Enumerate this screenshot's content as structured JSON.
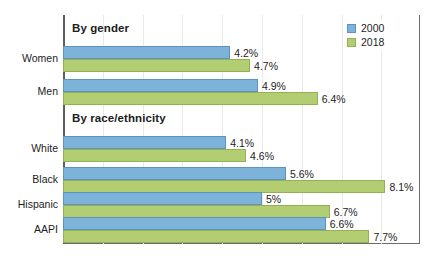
{
  "chart_data": {
    "type": "bar",
    "orientation": "horizontal",
    "title": "",
    "xlabel": "",
    "ylabel": "",
    "xlim": [
      0,
      9
    ],
    "grid": true,
    "legend_position": "top-right",
    "series": [
      {
        "name": "2000",
        "color": "#7db2d9"
      },
      {
        "name": "2018",
        "color": "#b2cd72"
      }
    ],
    "sections": [
      {
        "heading": "By gender",
        "categories": [
          "Women",
          "Men"
        ],
        "rows": [
          {
            "category": "Women",
            "values": [
              4.2,
              4.7
            ],
            "labels": [
              "4.2%",
              "4.7%"
            ]
          },
          {
            "category": "Men",
            "values": [
              4.9,
              6.4
            ],
            "labels": [
              "4.9%",
              "6.4%"
            ]
          }
        ]
      },
      {
        "heading": "By race/ethnicity",
        "categories": [
          "White",
          "Black",
          "Hispanic",
          "AAPI"
        ],
        "rows": [
          {
            "category": "White",
            "values": [
              4.1,
              4.6
            ],
            "labels": [
              "4.1%",
              "4.6%"
            ]
          },
          {
            "category": "Black",
            "values": [
              5.6,
              8.1
            ],
            "labels": [
              "5.6%",
              "8.1%"
            ]
          },
          {
            "category": "Hispanic",
            "values": [
              5.0,
              6.7
            ],
            "labels": [
              "5%",
              "6.7%"
            ]
          },
          {
            "category": "AAPI",
            "values": [
              6.6,
              7.7
            ],
            "labels": [
              "6.6%",
              "7.7%"
            ]
          }
        ]
      }
    ]
  },
  "legend": {
    "items": [
      {
        "label": "2000",
        "swatch": "legend-swatch-2000"
      },
      {
        "label": "2018",
        "swatch": "legend-swatch-2018"
      }
    ]
  },
  "sections": {
    "gender_heading": "By gender",
    "race_heading": "By race/ethnicity"
  },
  "colors": {
    "series_2000": "#7db2d9",
    "series_2018": "#b2cd72",
    "axis": "#5d5d5d",
    "grid": "#e9e9e9",
    "text": "#1d1d1d"
  }
}
